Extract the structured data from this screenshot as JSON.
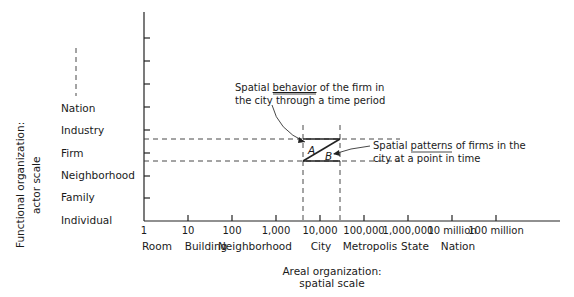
{
  "y_axis": {
    "title_line1": "Functional organization:",
    "title_line2": "actor scale",
    "labels": [
      "Individual",
      "Family",
      "Neighborhood",
      "Firm",
      "Industry",
      "Nation"
    ]
  },
  "x_axis": {
    "title_line1": "Areal organization:",
    "title_line2": "spatial scale",
    "tick_labels": [
      "1",
      "10",
      "100",
      "1,000",
      "10,000",
      "100,000",
      "1,000,000",
      "10 million",
      "100 million"
    ],
    "category_labels": [
      "Room",
      "Building",
      "Neighborhood",
      "City",
      "Metropolis",
      "State",
      "Nation"
    ]
  },
  "annotations": {
    "behavior_line1_pre": "Spatial ",
    "behavior_line1_em": "behavior",
    "behavior_line1_post": " of the firm in",
    "behavior_line2": "the city through a time period",
    "patterns_line1_pre": "Spatial ",
    "patterns_line1_em": "patterns",
    "patterns_line1_post": " of firms in the",
    "patterns_line2": "city at a point in time",
    "region_a": "A",
    "region_b": "B"
  }
}
